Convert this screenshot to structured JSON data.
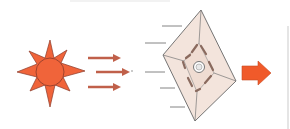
{
  "diagram": {
    "colors": {
      "sun_fill": "#f0643a",
      "sun_stroke": "#8a3a2a",
      "ray_arrow": "#c0604a",
      "sail_fill": "#f3e4dc",
      "sail_stroke": "#555555",
      "block_arrow": "#f05a2a",
      "speed_line": "#777777",
      "frame_line": "#d0d0d0"
    },
    "elements": [
      {
        "name": "sun",
        "icon": "sun-icon"
      },
      {
        "name": "light-rays",
        "count": 3,
        "icon": "arrow-right-icon"
      },
      {
        "name": "solar-sail",
        "icon": "kite-sail-icon"
      },
      {
        "name": "speed-lines",
        "count": 6
      },
      {
        "name": "motion-arrow",
        "icon": "block-arrow-right-icon"
      }
    ]
  }
}
